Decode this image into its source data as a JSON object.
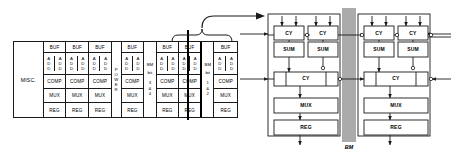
{
  "figure": {
    "left_diagram": {
      "name": "datapath-floorplan",
      "misc_label": "MISC.",
      "row_labels": {
        "buf": "BUF",
        "add": "ADD",
        "comp": "COMP",
        "mux": "MUX",
        "reg": "REG"
      },
      "add_letters": [
        "A",
        "D",
        "D"
      ],
      "power_label": "POWER",
      "power_letters": [
        "P",
        "O",
        "W",
        "E",
        "R"
      ],
      "slices": [
        {
          "id": "slice-1",
          "buf": "BUF",
          "adders": [
            "ADD",
            "ADD"
          ],
          "comp": "COMP",
          "mux": "MUX",
          "reg": "REG"
        },
        {
          "id": "slice-2",
          "buf": "BUF",
          "adders": [
            "ADD",
            "ADD"
          ],
          "comp": "COMP",
          "mux": "MUX",
          "reg": "REG"
        },
        {
          "id": "slice-3",
          "buf": "BUF",
          "adders": [
            "ADD",
            "ADD"
          ],
          "comp": "COMP",
          "mux": "MUX",
          "reg": "REG"
        },
        {
          "id": "slice-4",
          "buf": "BUF",
          "adders": [
            "ADD",
            "ADD"
          ],
          "comp": "COMP",
          "mux": "MUX",
          "reg": "REG"
        },
        {
          "id": "slice-5",
          "buf": "BUF",
          "adders": [
            "ADD",
            "ADD"
          ],
          "comp": "COMP",
          "mux": "MUX",
          "reg": "REG"
        },
        {
          "id": "slice-6",
          "buf": "BUF",
          "adders": [
            "ADD",
            "ADD"
          ],
          "comp": "COMP",
          "mux": "MUX",
          "reg": "REG"
        },
        {
          "id": "slice-7",
          "buf": "BUF",
          "adders": [
            "ADD",
            "ADD"
          ],
          "comp": "COMP",
          "mux": "MUX",
          "reg": "REG"
        }
      ],
      "bm_bit_columns": [
        {
          "id": "bm-bit-34",
          "head_line1": "BM",
          "head_line2": "bit",
          "num_top": "3",
          "amp": "&",
          "num_bottom": "4"
        },
        {
          "id": "bm-bit-12",
          "head_line1": "BM",
          "head_line2": "bit",
          "num_top": "1",
          "amp": "&",
          "num_bottom": "2"
        }
      ]
    },
    "right_diagram": {
      "name": "bit-slice-schematic",
      "cy_label": "CY",
      "sum_label": "SUM",
      "mux_label": "MUX",
      "reg_label": "REG",
      "bus_label": "BM",
      "top_cy_blocks": [
        "CY",
        "CY",
        "CY",
        "CY"
      ],
      "sum_blocks": [
        "SUM",
        "SUM",
        "SUM",
        "SUM"
      ],
      "carry_blocks": [
        "CY",
        "CY"
      ],
      "mux_blocks": [
        "MUX",
        "MUX"
      ],
      "reg_blocks": [
        "REG",
        "REG"
      ]
    },
    "colors": {
      "line": "#1a1a1a",
      "thick_line": "#000000",
      "bus": "#3a3a3a",
      "background": "#ffffff"
    }
  }
}
